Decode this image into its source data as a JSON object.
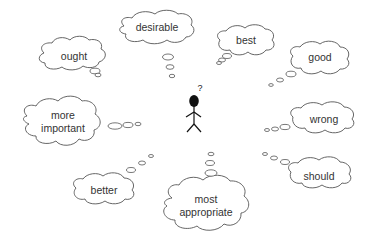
{
  "diagram": {
    "center_figure": {
      "type": "stick-figure",
      "thought_symbol": "?"
    },
    "thought_clouds": [
      {
        "id": "ought",
        "label": "ought"
      },
      {
        "id": "desirable",
        "label": "desirable"
      },
      {
        "id": "best",
        "label": "best"
      },
      {
        "id": "good",
        "label": "good"
      },
      {
        "id": "more-important",
        "label": "more\nimportant",
        "line1": "more",
        "line2": "important"
      },
      {
        "id": "wrong",
        "label": "wrong"
      },
      {
        "id": "should",
        "label": "should"
      },
      {
        "id": "better",
        "label": "better"
      },
      {
        "id": "most-appropriate",
        "label": "most\nappropriate",
        "line1": "most",
        "line2": "appropriate"
      }
    ],
    "colors": {
      "outline": "#555555",
      "text": "#333333",
      "figure": "#111111",
      "background": "#ffffff"
    }
  }
}
